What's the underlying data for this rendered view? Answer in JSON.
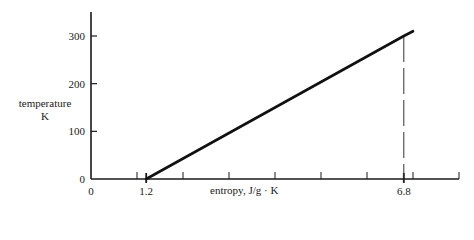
{
  "chart_data": {
    "type": "line",
    "title": "",
    "xlabel": "entropy, J/g · K",
    "ylabel": "temperature",
    "ylabel_unit": "K",
    "xlim": [
      0,
      8
    ],
    "ylim": [
      0,
      350
    ],
    "x_tick_labels": [
      {
        "value": 0,
        "label": "0"
      },
      {
        "value": 1.2,
        "label": "1.2"
      },
      {
        "value": 6.8,
        "label": "6.8"
      }
    ],
    "x_minor_ticks": [
      1,
      2,
      3,
      4,
      5,
      6,
      7,
      8
    ],
    "y_ticks": [
      0,
      100,
      200,
      300
    ],
    "y_tick_labels": [
      "0",
      "100",
      "200",
      "300"
    ],
    "grid": false,
    "legend": null,
    "series": [
      {
        "name": "temperature vs entropy",
        "x": [
          1.2,
          6.8,
          7.0
        ],
        "y": [
          0,
          300,
          310
        ]
      }
    ],
    "annotations": [
      {
        "type": "dashed-vertical-line",
        "x": 6.8,
        "y_from": 0,
        "y_to": 300
      }
    ]
  }
}
